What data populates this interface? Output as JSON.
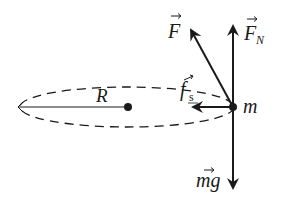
{
  "diagram": {
    "colors": {
      "stroke": "#1a1a1a",
      "background": "#ffffff"
    },
    "labels": {
      "radius": "R",
      "mass": "m",
      "applied_force": "F",
      "normal_force": "F",
      "normal_force_subscript": "N",
      "static_friction": "f",
      "static_friction_subscript": "s",
      "weight": "mg"
    },
    "vectors": [
      {
        "name": "F",
        "label": "F",
        "direction": "up-left",
        "from": [
          233,
          107
        ],
        "to": [
          188,
          25
        ]
      },
      {
        "name": "F_N",
        "label": "F_N",
        "direction": "up",
        "from": [
          233,
          107
        ],
        "to": [
          233,
          22
        ]
      },
      {
        "name": "f_s",
        "label": "f_s",
        "direction": "left (toward center)",
        "from": [
          233,
          107
        ],
        "to": [
          189,
          107
        ]
      },
      {
        "name": "mg",
        "label": "mg",
        "direction": "down",
        "from": [
          233,
          107
        ],
        "to": [
          233,
          192
        ]
      }
    ],
    "path": {
      "shape": "dashed ellipse",
      "center": [
        127,
        107
      ],
      "rx": 107,
      "ry": 20
    },
    "radius_line": {
      "from": [
        128,
        107
      ],
      "to": [
        18,
        107
      ]
    }
  }
}
